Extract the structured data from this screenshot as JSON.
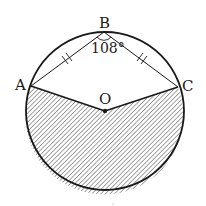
{
  "diagram": {
    "type": "circle-geometry",
    "circle": {
      "center": "O",
      "cx": 105,
      "cy": 111,
      "r": 79
    },
    "points": {
      "A": {
        "label": "A",
        "x": 31,
        "y": 86
      },
      "B": {
        "label": "B",
        "x": 104,
        "y": 32
      },
      "C": {
        "label": "C",
        "x": 178,
        "y": 87
      },
      "O": {
        "label": "O",
        "x": 105,
        "y": 111
      }
    },
    "segments": [
      {
        "from": "A",
        "to": "B",
        "tick_marks": 2
      },
      {
        "from": "B",
        "to": "C",
        "tick_marks": 2
      },
      {
        "from": "A",
        "to": "O",
        "tick_marks": 0
      },
      {
        "from": "O",
        "to": "C",
        "tick_marks": 0
      }
    ],
    "angle": {
      "vertex": "B",
      "label": "108°",
      "value_degrees": 108
    },
    "shaded_region": {
      "description": "major sector bounded by OA, OC and the lower arc AC",
      "fill": "diagonal-hatch"
    },
    "colors": {
      "stroke": "#1a1a1a",
      "hatch": "#555555",
      "background": "#ffffff"
    }
  }
}
